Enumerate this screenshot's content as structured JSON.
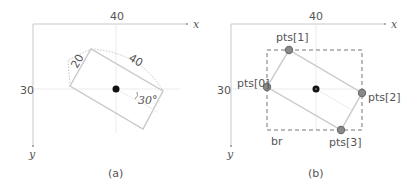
{
  "panels": [
    {
      "id": "a",
      "caption": "(a)",
      "axes": {
        "x_label": "x",
        "y_label": "y",
        "x_tick": "40",
        "y_tick": "30"
      },
      "annotations": {
        "width_label": "40",
        "height_label": "20",
        "angle_label": "30°"
      },
      "rect_corners": [
        [
          70,
          86
        ],
        [
          91,
          49
        ],
        [
          163,
          91
        ],
        [
          143,
          129
        ]
      ],
      "center": [
        116,
        90
      ]
    },
    {
      "id": "b",
      "caption": "(b)",
      "axes": {
        "x_label": "x",
        "y_label": "y",
        "x_tick": "40",
        "y_tick": "30"
      },
      "points": [
        {
          "label": "pts[0]",
          "pos": [
            267,
            87
          ]
        },
        {
          "label": "pts[1]",
          "pos": [
            289,
            50
          ]
        },
        {
          "label": "pts[2]",
          "pos": [
            362,
            93
          ]
        },
        {
          "label": "pts[3]",
          "pos": [
            341,
            130
          ]
        }
      ],
      "bounding_rect_label": "br",
      "center": [
        316,
        90
      ]
    }
  ],
  "colors": {
    "axis": "#bbbbbb",
    "rect": "#c8c8c8",
    "guide": "#e6e6e6",
    "dotted": "#aaaaaa",
    "point_fill": "#8a8a8a",
    "point_stroke": "#6f6f6f",
    "center": "#111111",
    "text": "#555555"
  }
}
